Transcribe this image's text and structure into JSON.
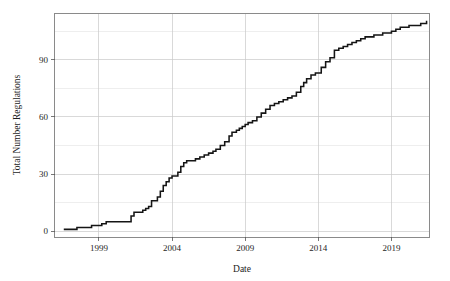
{
  "chart_data": {
    "type": "line",
    "title": "",
    "subtitle": "",
    "xlabel": "Date",
    "ylabel": "Total Number Regulations",
    "xlim": [
      1996.0,
      2021.6
    ],
    "ylim": [
      -3,
      114
    ],
    "grid": true,
    "legend": null,
    "legend_position": "none",
    "x_ticks": [
      1999,
      2004,
      2009,
      2014,
      2019
    ],
    "x_tick_labels": [
      "1999",
      "2004",
      "2009",
      "2014",
      "2019"
    ],
    "y_ticks": [
      0,
      30,
      60,
      90
    ],
    "y_tick_labels": [
      "0",
      "30",
      "60",
      "90"
    ],
    "y_gridlines_minor": [
      15,
      45,
      75,
      105
    ],
    "line_color": "#151515",
    "line_style": "step-post",
    "series": [
      {
        "name": "Total Number Regulations",
        "x": [
          1996.6,
          1997.3,
          1997.5,
          1998.1,
          1998.5,
          1998.9,
          1999.2,
          1999.5,
          1999.8,
          2000.0,
          2000.3,
          2000.7,
          2001.0,
          2001.2,
          2001.4,
          2001.6,
          2001.8,
          2002.0,
          2002.2,
          2002.4,
          2002.6,
          2002.8,
          2003.0,
          2003.2,
          2003.4,
          2003.6,
          2003.8,
          2004.0,
          2004.2,
          2004.4,
          2004.6,
          2004.8,
          2005.0,
          2005.3,
          2005.6,
          2005.9,
          2006.2,
          2006.5,
          2006.8,
          2007.0,
          2007.3,
          2007.6,
          2007.9,
          2008.1,
          2008.4,
          2008.6,
          2008.8,
          2009.0,
          2009.2,
          2009.5,
          2009.8,
          2010.1,
          2010.4,
          2010.7,
          2011.0,
          2011.3,
          2011.6,
          2011.9,
          2012.2,
          2012.5,
          2012.8,
          2013.0,
          2013.2,
          2013.5,
          2013.8,
          2014.0,
          2014.2,
          2014.5,
          2014.8,
          2015.1,
          2015.4,
          2015.7,
          2016.0,
          2016.3,
          2016.6,
          2016.9,
          2017.2,
          2017.5,
          2017.8,
          2018.1,
          2018.4,
          2018.7,
          2019.0,
          2019.3,
          2019.6,
          2019.9,
          2020.2,
          2020.6,
          2021.0,
          2021.4
        ],
        "y": [
          1,
          1,
          2,
          2,
          3,
          3,
          4,
          5,
          5,
          5,
          5,
          5,
          5,
          8,
          10,
          10,
          10,
          11,
          12,
          13,
          16,
          16,
          18,
          21,
          24,
          26,
          28,
          29,
          29,
          31,
          34,
          36,
          37,
          37,
          38,
          39,
          40,
          41,
          42,
          43,
          45,
          47,
          50,
          52,
          53,
          54,
          55,
          56,
          57,
          58,
          60,
          62,
          64,
          66,
          67,
          68,
          69,
          70,
          71,
          73,
          76,
          78,
          80,
          82,
          83,
          83,
          86,
          89,
          91,
          95,
          96,
          97,
          98,
          99,
          100,
          101,
          102,
          102,
          103,
          103,
          104,
          104,
          105,
          106,
          107,
          107,
          108,
          108,
          109,
          110
        ]
      }
    ],
    "summary": {
      "start_year": "1996",
      "start_value": "1",
      "end_year": "2021",
      "end_value": "110"
    }
  }
}
